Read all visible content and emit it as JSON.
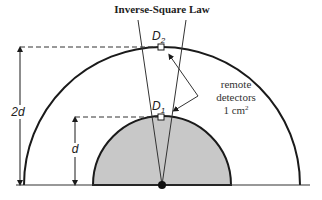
{
  "title": "Inverse-Square Law",
  "labels": {
    "d2": {
      "main": "D",
      "sub": "2"
    },
    "d1": {
      "main": "D",
      "sub": "1"
    },
    "outer_distance": "2d",
    "inner_distance": "d"
  },
  "annotation": {
    "line1": "remote",
    "line2": "detectors",
    "line3": "1 cm",
    "line3_sup": "2"
  },
  "colors": {
    "inner_fill": "#c8c8c8",
    "stroke": "#1a1a1a"
  }
}
